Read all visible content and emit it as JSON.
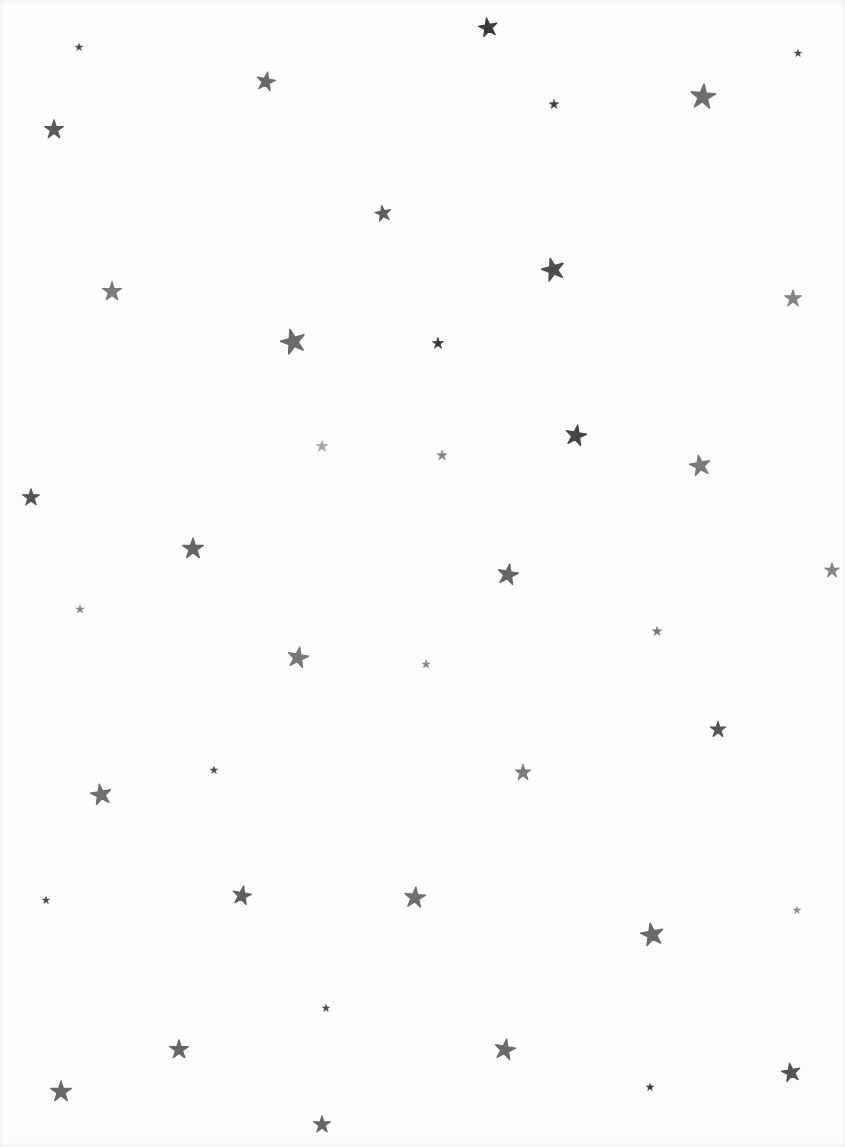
{
  "scene": {
    "description": "Scattered gray watercolor stars on white paper",
    "background": "#fdfdfd",
    "stars": [
      {
        "x": 488,
        "y": 27,
        "s": 20,
        "c": "#3a3a3a",
        "r": -10
      },
      {
        "x": 79,
        "y": 47,
        "s": 8,
        "c": "#444",
        "r": 0
      },
      {
        "x": 798,
        "y": 53,
        "s": 8,
        "c": "#444",
        "r": 0
      },
      {
        "x": 266,
        "y": 81,
        "s": 20,
        "c": "#6a6a6a",
        "r": 10
      },
      {
        "x": 703,
        "y": 96,
        "s": 26,
        "c": "#6e6e6e",
        "r": 5
      },
      {
        "x": 554,
        "y": 104,
        "s": 10,
        "c": "#3e3e3e",
        "r": 0
      },
      {
        "x": 54,
        "y": 129,
        "s": 20,
        "c": "#5a5a5a",
        "r": 0
      },
      {
        "x": 383,
        "y": 213,
        "s": 17,
        "c": "#5e5e5e",
        "r": -10
      },
      {
        "x": 553,
        "y": 269,
        "s": 24,
        "c": "#4e4e4e",
        "r": -15
      },
      {
        "x": 112,
        "y": 291,
        "s": 20,
        "c": "#7a7a7a",
        "r": 0
      },
      {
        "x": 793,
        "y": 298,
        "s": 18,
        "c": "#858585",
        "r": 0
      },
      {
        "x": 293,
        "y": 341,
        "s": 26,
        "c": "#6a6a6a",
        "r": -15
      },
      {
        "x": 438,
        "y": 343,
        "s": 12,
        "c": "#3a3a3a",
        "r": 0
      },
      {
        "x": 576,
        "y": 435,
        "s": 22,
        "c": "#454545",
        "r": 10
      },
      {
        "x": 322,
        "y": 446,
        "s": 12,
        "c": "#a5a5a5",
        "r": 0
      },
      {
        "x": 442,
        "y": 455,
        "s": 11,
        "c": "#888",
        "r": 0
      },
      {
        "x": 700,
        "y": 465,
        "s": 22,
        "c": "#7a7a7a",
        "r": -10
      },
      {
        "x": 31,
        "y": 497,
        "s": 18,
        "c": "#555",
        "r": 0
      },
      {
        "x": 193,
        "y": 548,
        "s": 22,
        "c": "#666",
        "r": 0
      },
      {
        "x": 508,
        "y": 574,
        "s": 22,
        "c": "#666",
        "r": 10
      },
      {
        "x": 832,
        "y": 570,
        "s": 16,
        "c": "#888",
        "r": 0
      },
      {
        "x": 80,
        "y": 609,
        "s": 9,
        "c": "#888",
        "r": 0
      },
      {
        "x": 657,
        "y": 631,
        "s": 10,
        "c": "#777",
        "r": 0
      },
      {
        "x": 298,
        "y": 657,
        "s": 22,
        "c": "#777",
        "r": 10
      },
      {
        "x": 426,
        "y": 664,
        "s": 9,
        "c": "#888",
        "r": 0
      },
      {
        "x": 718,
        "y": 729,
        "s": 17,
        "c": "#555",
        "r": 0
      },
      {
        "x": 214,
        "y": 770,
        "s": 8,
        "c": "#444",
        "r": 0
      },
      {
        "x": 523,
        "y": 772,
        "s": 17,
        "c": "#7a7a7a",
        "r": 0
      },
      {
        "x": 101,
        "y": 794,
        "s": 22,
        "c": "#6e6e6e",
        "r": -10
      },
      {
        "x": 242,
        "y": 895,
        "s": 20,
        "c": "#5e5e5e",
        "r": 10
      },
      {
        "x": 415,
        "y": 897,
        "s": 22,
        "c": "#6e6e6e",
        "r": 5
      },
      {
        "x": 46,
        "y": 900,
        "s": 8,
        "c": "#444",
        "r": 0
      },
      {
        "x": 797,
        "y": 910,
        "s": 8,
        "c": "#888",
        "r": 0
      },
      {
        "x": 652,
        "y": 934,
        "s": 24,
        "c": "#6a6a6a",
        "r": -10
      },
      {
        "x": 326,
        "y": 1008,
        "s": 8,
        "c": "#444",
        "r": 0
      },
      {
        "x": 179,
        "y": 1049,
        "s": 20,
        "c": "#666",
        "r": 0
      },
      {
        "x": 505,
        "y": 1049,
        "s": 22,
        "c": "#6a6a6a",
        "r": 10
      },
      {
        "x": 791,
        "y": 1072,
        "s": 20,
        "c": "#555",
        "r": -10
      },
      {
        "x": 650,
        "y": 1087,
        "s": 8,
        "c": "#333",
        "r": 0
      },
      {
        "x": 61,
        "y": 1091,
        "s": 22,
        "c": "#6a6a6a",
        "r": 0
      },
      {
        "x": 322,
        "y": 1124,
        "s": 18,
        "c": "#666",
        "r": 0
      }
    ]
  }
}
